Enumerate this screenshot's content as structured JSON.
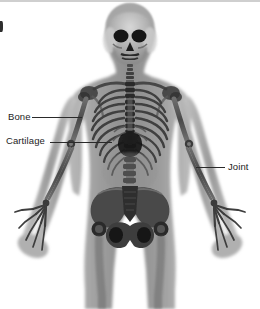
{
  "figure": {
    "view": "anterior full-body",
    "background_color": "#ffffff",
    "bone_color": "#3a3a3a",
    "soft_tissue_color": "#9a9a9a",
    "cavity_color": "#1a1a1a",
    "width": 260,
    "height": 309
  },
  "annotations": {
    "line_color": "#2a2a2a",
    "text_color": "#1d1d1d",
    "items": [
      {
        "id": "bone",
        "label": "Bone",
        "text_x": 8,
        "text_y": 111,
        "line_x": 32,
        "line_y": 117,
        "line_width": 50,
        "target": "humerus (upper arm bone)"
      },
      {
        "id": "cartilage",
        "label": "Cartilage",
        "text_x": 6,
        "text_y": 135,
        "line_x": 50,
        "line_y": 142,
        "line_width": 62,
        "target": "costal cartilage at sternum"
      },
      {
        "id": "joint",
        "label": "Joint",
        "text_x": 228,
        "text_y": 161,
        "line_x": 196,
        "line_y": 167,
        "line_width": 29,
        "target": "elbow joint"
      }
    ]
  },
  "edge_marks": {
    "top_strip": "grey scan border",
    "left_mark": "dark scan artifact"
  }
}
